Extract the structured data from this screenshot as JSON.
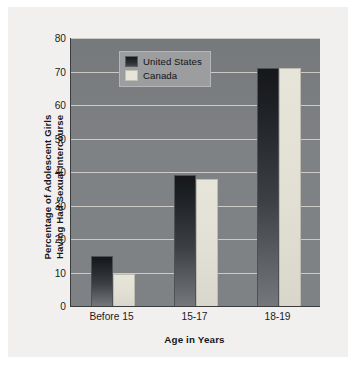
{
  "chart_data": {
    "type": "bar",
    "title": "",
    "subtitle": "",
    "xlabel": "Age in Years",
    "ylabel": "Percentage of Adolescent Girls Having Had Sexual Intercourse",
    "ylabel_lines": [
      "Percentage of Adolescent Girls",
      "Having Had Sexual Intercourse"
    ],
    "categories": [
      "Before 15",
      "15-17",
      "18-19"
    ],
    "series": [
      {
        "name": "United States",
        "values": [
          15,
          39,
          71
        ],
        "color": "#1b1e21"
      },
      {
        "name": "Canada",
        "values": [
          9.5,
          38,
          71
        ],
        "color": "#e7e4da"
      }
    ],
    "ylim": [
      0,
      80
    ],
    "yticks": [
      0,
      10,
      20,
      30,
      40,
      50,
      60,
      70,
      80
    ],
    "ytick_labels": [
      "0",
      "10",
      "20",
      "30",
      "40",
      "50",
      "60",
      "70",
      "80"
    ],
    "grid": true,
    "grid_axis": "y",
    "legend_position": "upper left",
    "plot_background": "#7f8285",
    "figure_background": "#f1f0ee",
    "gridline_color": "#d8d7d2",
    "axis_color": "#3a3c3e"
  }
}
